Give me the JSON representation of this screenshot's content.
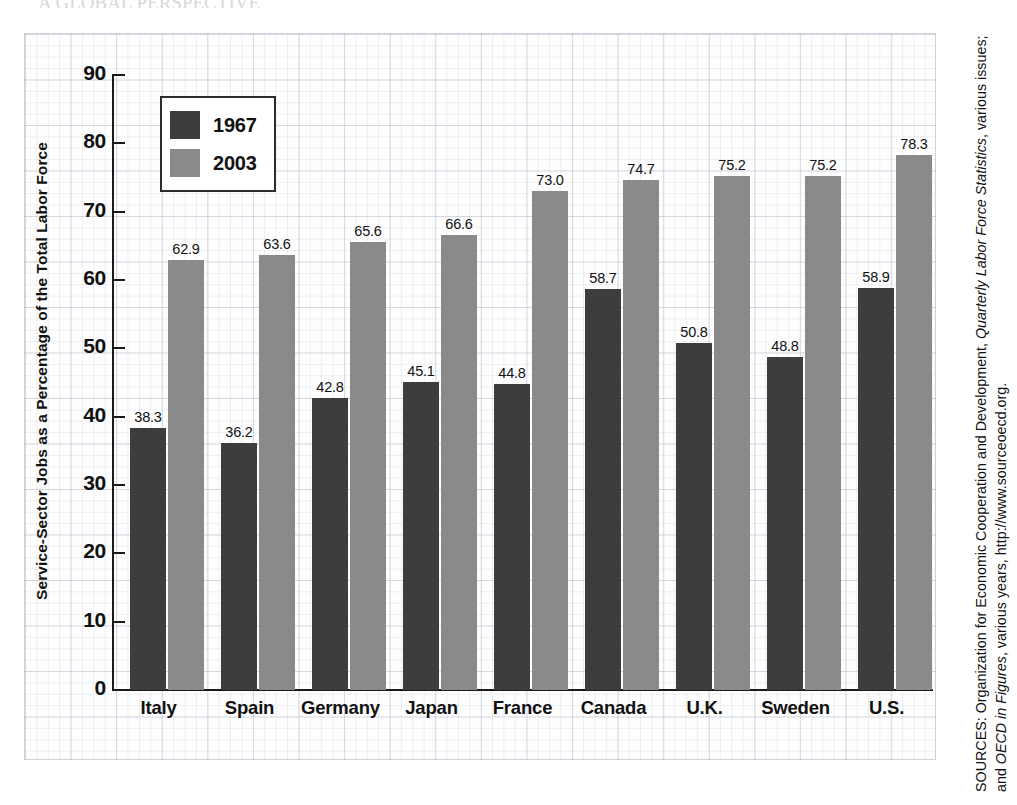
{
  "top_cut_text": "A GLOBAL PERSPECTIVE",
  "chart_data": {
    "type": "bar",
    "title": "",
    "xlabel": "",
    "ylabel": "Service-Sector Jobs as a Percentage of the Total Labor Force",
    "ylim": [
      0,
      90
    ],
    "yticks": [
      90,
      80,
      70,
      60,
      50,
      40,
      30,
      20,
      10,
      0
    ],
    "grid": true,
    "legend_position": "top-left-inside",
    "categories": [
      "Italy",
      "Spain",
      "Germany",
      "Japan",
      "France",
      "Canada",
      "U.K.",
      "Sweden",
      "U.S."
    ],
    "series": [
      {
        "name": "1967",
        "color": "#3d3d3d",
        "values": [
          38.3,
          36.2,
          42.8,
          45.1,
          44.8,
          58.7,
          50.8,
          48.8,
          58.9
        ],
        "labels": [
          "38.3",
          "36.2",
          "42.8",
          "45.1",
          "44.8",
          "58.7",
          "50.8",
          "48.8",
          "58.9"
        ]
      },
      {
        "name": "2003",
        "color": "#8a8a8a",
        "values": [
          62.9,
          63.6,
          65.6,
          66.6,
          73.0,
          74.7,
          75.2,
          75.2,
          78.3
        ],
        "labels": [
          "62.9",
          "63.6",
          "65.6",
          "66.6",
          "73.0",
          "74.7",
          "75.2",
          "75.2",
          "78.3"
        ]
      }
    ]
  },
  "legend": {
    "items": [
      {
        "label": "1967",
        "color": "#3d3d3d"
      },
      {
        "label": "2003",
        "color": "#8a8a8a"
      }
    ]
  },
  "source_note": {
    "prefix": "SOURCES: Organization for Economic Cooperation and Development, ",
    "italic1": "Quarterly Labor Force Statistics",
    "middle": ", various issues; and ",
    "italic2": "OECD in Figures",
    "suffix": ", various years, http://www.sourceoecd.org.",
    "full": "SOURCES: Organization for Economic Cooperation and Development, Quarterly Labor Force Statistics, various issues; and OECD in Figures, various years, http://www.sourceoecd.org."
  },
  "colors": {
    "series_1967": "#3d3d3d",
    "series_2003": "#8a8a8a",
    "axis": "#1a1a1a",
    "grid": "#b0b7c8",
    "text": "#111111",
    "paper": "#fefeff"
  }
}
